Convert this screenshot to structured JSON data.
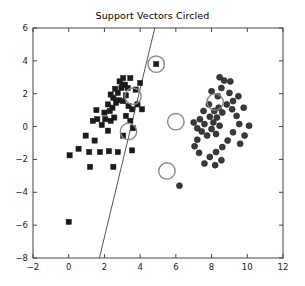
{
  "chart_data": {
    "type": "scatter",
    "title": "Support Vectors Circled",
    "xlabel": "",
    "ylabel": "",
    "xlim": [
      -2,
      12
    ],
    "ylim": [
      -8,
      6
    ],
    "xticks": [
      -2,
      0,
      2,
      4,
      6,
      8,
      10,
      12
    ],
    "yticks": [
      -8,
      -6,
      -4,
      -2,
      0,
      2,
      4,
      6
    ],
    "xtick_labels": [
      "−2",
      "0",
      "2",
      "4",
      "6",
      "8",
      "10",
      "12"
    ],
    "ytick_labels": [
      "−8",
      "−6",
      "−4",
      "−2",
      "0",
      "2",
      "4",
      "6"
    ],
    "grid": false,
    "legend": null,
    "marker_colors": {
      "class_square": "#1a1a1a",
      "class_circle": "#3a3a3a",
      "support_vector_circle": "#8a8a8a",
      "decision_boundary": "#555555",
      "axes": "#444444"
    },
    "series": [
      {
        "name": "class -1",
        "marker": "square",
        "color": "#1a1a1a",
        "points": [
          [
            0.0,
            -5.8
          ],
          [
            0.05,
            -1.75
          ],
          [
            0.55,
            -1.35
          ],
          [
            1.15,
            -1.55
          ],
          [
            0.95,
            -0.55
          ],
          [
            1.45,
            -0.85
          ],
          [
            1.2,
            -2.45
          ],
          [
            1.75,
            -1.55
          ],
          [
            2.25,
            -1.5
          ],
          [
            2.2,
            -0.25
          ],
          [
            1.85,
            0.1
          ],
          [
            2.05,
            0.45
          ],
          [
            2.35,
            0.35
          ],
          [
            2.0,
            0.85
          ],
          [
            2.3,
            0.95
          ],
          [
            2.55,
            0.55
          ],
          [
            2.45,
            1.15
          ],
          [
            2.2,
            1.35
          ],
          [
            2.65,
            1.45
          ],
          [
            2.5,
            1.75
          ],
          [
            2.8,
            1.6
          ],
          [
            2.35,
            1.95
          ],
          [
            2.75,
            2.05
          ],
          [
            2.6,
            2.3
          ],
          [
            2.95,
            2.35
          ],
          [
            3.0,
            2.55
          ],
          [
            2.85,
            2.75
          ],
          [
            3.15,
            2.55
          ],
          [
            3.05,
            2.95
          ],
          [
            3.3,
            2.35
          ],
          [
            3.2,
            1.9
          ],
          [
            3.05,
            1.55
          ],
          [
            3.35,
            1.25
          ],
          [
            3.55,
            1.05
          ],
          [
            3.2,
            0.65
          ],
          [
            3.45,
            0.35
          ],
          [
            3.6,
            -0.1
          ],
          [
            3.05,
            -0.55
          ],
          [
            3.55,
            -1.45
          ],
          [
            2.75,
            -1.55
          ],
          [
            1.6,
            0.45
          ],
          [
            1.55,
            1.0
          ],
          [
            1.35,
            0.35
          ],
          [
            3.45,
            2.95
          ],
          [
            3.75,
            2.25
          ],
          [
            3.85,
            1.35
          ],
          [
            4.0,
            2.65
          ],
          [
            4.1,
            1.05
          ],
          [
            4.9,
            3.8
          ],
          [
            2.5,
            -2.45
          ]
        ]
      },
      {
        "name": "class +1",
        "marker": "circle",
        "color": "#3a3a3a",
        "points": [
          [
            6.2,
            -3.6
          ],
          [
            7.2,
            -0.1
          ],
          [
            7.0,
            0.25
          ],
          [
            7.35,
            0.45
          ],
          [
            7.6,
            0.15
          ],
          [
            7.45,
            -0.3
          ],
          [
            7.75,
            -0.55
          ],
          [
            7.2,
            -0.8
          ],
          [
            7.9,
            0.6
          ],
          [
            8.1,
            0.25
          ],
          [
            8.3,
            0.55
          ],
          [
            8.0,
            -0.15
          ],
          [
            8.25,
            -0.45
          ],
          [
            8.45,
            0.05
          ],
          [
            8.15,
            0.95
          ],
          [
            8.4,
            1.15
          ],
          [
            8.6,
            0.85
          ],
          [
            8.35,
            1.85
          ],
          [
            8.0,
            2.15
          ],
          [
            8.55,
            2.35
          ],
          [
            8.7,
            2.8
          ],
          [
            8.45,
            3.0
          ],
          [
            9.0,
            2.05
          ],
          [
            9.2,
            1.55
          ],
          [
            9.5,
            1.85
          ],
          [
            9.15,
            1.05
          ],
          [
            9.4,
            0.65
          ],
          [
            9.8,
            1.15
          ],
          [
            9.55,
            0.15
          ],
          [
            9.2,
            -0.35
          ],
          [
            8.9,
            -0.85
          ],
          [
            8.6,
            -1.25
          ],
          [
            8.25,
            -1.55
          ],
          [
            7.9,
            -1.85
          ],
          [
            8.55,
            -2.05
          ],
          [
            8.2,
            -2.35
          ],
          [
            7.6,
            -2.25
          ],
          [
            7.3,
            -1.6
          ],
          [
            7.05,
            -1.2
          ],
          [
            9.6,
            -1.05
          ],
          [
            9.85,
            -0.55
          ],
          [
            10.1,
            0.05
          ],
          [
            9.05,
            2.75
          ],
          [
            8.85,
            1.35
          ],
          [
            7.85,
            1.35
          ],
          [
            7.55,
            0.95
          ]
        ]
      }
    ],
    "support_vectors": [
      {
        "x": 4.9,
        "y": 3.8,
        "marker": "square"
      },
      {
        "x": 3.6,
        "y": 1.85,
        "marker": "square"
      },
      {
        "x": 3.35,
        "y": -0.3,
        "marker": "square"
      },
      {
        "x": 6.0,
        "y": 0.3,
        "marker": "circle"
      },
      {
        "x": 8.2,
        "y": 1.5,
        "marker": "circle"
      },
      {
        "x": 5.5,
        "y": -2.7,
        "marker": "circle"
      }
    ],
    "decision_boundary": {
      "type": "line",
      "x0": 1.72,
      "y0": -8,
      "x1": 4.82,
      "y1": 6
    }
  }
}
